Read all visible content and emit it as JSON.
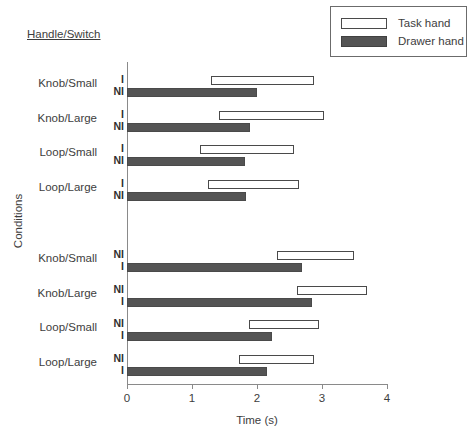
{
  "chart_data": {
    "type": "bar",
    "orientation": "horizontal",
    "title": "",
    "group_title": "Handle/Switch",
    "xlabel": "Time (s)",
    "ylabel": "Conditions",
    "xlim": [
      0,
      4
    ],
    "xticks": [
      0,
      1,
      2,
      3,
      4
    ],
    "xtick_labels": [
      "0",
      "1",
      "2",
      "3",
      "4"
    ],
    "grid": false,
    "legend": {
      "position": "top-right",
      "entries": [
        {
          "name": "Task hand",
          "style": "outlined",
          "color": "#ffffff"
        },
        {
          "name": "Drawer hand",
          "style": "filled",
          "color": "#545454"
        }
      ]
    },
    "groups": [
      {
        "name": "Handle/Switch",
        "marker_order": [
          "I",
          "NI"
        ],
        "rows": [
          {
            "condition": "Knob/Small",
            "bars": [
              {
                "series": "Task hand",
                "marker": "I",
                "start": 1.29,
                "end": 2.87
              },
              {
                "series": "Drawer hand",
                "marker": "NI",
                "start": 0.0,
                "end": 2.0
              }
            ]
          },
          {
            "condition": "Knob/Large",
            "bars": [
              {
                "series": "Task hand",
                "marker": "I",
                "start": 1.41,
                "end": 3.03
              },
              {
                "series": "Drawer hand",
                "marker": "NI",
                "start": 0.0,
                "end": 1.89
              }
            ]
          },
          {
            "condition": "Loop/Small",
            "bars": [
              {
                "series": "Task hand",
                "marker": "I",
                "start": 1.13,
                "end": 2.57
              },
              {
                "series": "Drawer hand",
                "marker": "NI",
                "start": 0.0,
                "end": 1.81
              }
            ]
          },
          {
            "condition": "Loop/Large",
            "bars": [
              {
                "series": "Task hand",
                "marker": "I",
                "start": 1.24,
                "end": 2.64
              },
              {
                "series": "Drawer hand",
                "marker": "NI",
                "start": 0.0,
                "end": 1.83
              }
            ]
          }
        ]
      },
      {
        "name": "",
        "marker_order": [
          "NI",
          "I"
        ],
        "rows": [
          {
            "condition": "Knob/Small",
            "bars": [
              {
                "series": "Task hand",
                "marker": "NI",
                "start": 2.31,
                "end": 3.5
              },
              {
                "series": "Drawer hand",
                "marker": "I",
                "start": 0.0,
                "end": 2.69
              }
            ]
          },
          {
            "condition": "Knob/Large",
            "bars": [
              {
                "series": "Task hand",
                "marker": "NI",
                "start": 2.62,
                "end": 3.69
              },
              {
                "series": "Drawer hand",
                "marker": "I",
                "start": 0.0,
                "end": 2.84
              }
            ]
          },
          {
            "condition": "Loop/Small",
            "bars": [
              {
                "series": "Task hand",
                "marker": "NI",
                "start": 1.88,
                "end": 2.95
              },
              {
                "series": "Drawer hand",
                "marker": "I",
                "start": 0.0,
                "end": 2.23
              }
            ]
          },
          {
            "condition": "Loop/Large",
            "bars": [
              {
                "series": "Task hand",
                "marker": "NI",
                "start": 1.72,
                "end": 2.87
              },
              {
                "series": "Drawer hand",
                "marker": "I",
                "start": 0.0,
                "end": 2.15
              }
            ]
          }
        ]
      }
    ]
  },
  "colors": {
    "task_hand": "#ffffff",
    "drawer_hand": "#545454",
    "axis": "#8a8a8a",
    "text": "#3d3d3d",
    "outline": "#4a4a4a"
  }
}
